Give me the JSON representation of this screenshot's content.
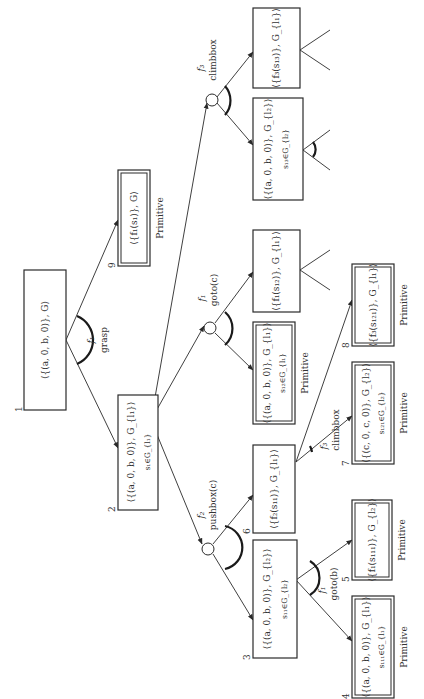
{
  "diagram": {
    "title": "",
    "orientation": "rotated-90-ccw",
    "nodes": [
      {
        "id": "1",
        "number": "1",
        "label": "⟨{(a, 0, b, 0)}, G⟩",
        "condition": "",
        "primitive": false,
        "primitive_label": ""
      },
      {
        "id": "9",
        "number": "9",
        "label": "⟨{f₁(s₁)}, G⟩",
        "condition": "",
        "primitive": true,
        "primitive_label": "Primitive"
      },
      {
        "id": "2",
        "number": "2",
        "label": "⟨{(a, 0, b, 0)}, G_{l₁}⟩",
        "condition": "s₁∈G_{l₁}",
        "primitive": false,
        "primitive_label": ""
      },
      {
        "id": "3",
        "number": "3",
        "label": "⟨{(a, 0, b, 0)}, G_{l₂}⟩",
        "condition": "s₁₁∈G_{l₂}",
        "primitive": false,
        "primitive_label": ""
      },
      {
        "id": "6",
        "number": "6",
        "label": "⟨{f₂(s₁₁)}, G_{l₁}⟩",
        "condition": "",
        "primitive": false,
        "primitive_label": ""
      },
      {
        "id": "4",
        "number": "4",
        "label": "⟨{(a, 0, b, 0)}, G_{l₁}⟩",
        "condition": "s₁₁₁∈G_{l₁}",
        "primitive": true,
        "primitive_label": "Primitive"
      },
      {
        "id": "5",
        "number": "5",
        "label": "⟨{f₁(s₁₁₁)}, G_{l₂}⟩",
        "condition": "",
        "primitive": true,
        "primitive_label": "Primitive"
      },
      {
        "id": "7",
        "number": "7",
        "label": "⟨{(c, 0, c, 0)}, G_{l₂}⟩",
        "condition": "s₁₂₁∈G_{l₂}",
        "primitive": true,
        "primitive_label": "Primitive"
      },
      {
        "id": "8",
        "number": "8",
        "label": "⟨{f₃(s₁₂₁)}, G_{l₁}⟩",
        "condition": "",
        "primitive": true,
        "primitive_label": "Primitive"
      },
      {
        "id": "g1",
        "number": "",
        "label": "⟨{(a, 0, b, 0)}, G_{l₁}⟩",
        "condition": "s₁₂∈G_{l₁}",
        "primitive": true,
        "primitive_label": "Primitive"
      },
      {
        "id": "g2",
        "number": "",
        "label": "⟨{f₁(s₁₂)}, G_{l₁}⟩",
        "condition": "",
        "primitive": false,
        "primitive_label": ""
      },
      {
        "id": "c1",
        "number": "",
        "label": "⟨{(a, 0, b, 0)}, G_{l₂}⟩",
        "condition": "s₁₃∈G_{l₂}",
        "primitive": false,
        "primitive_label": ""
      },
      {
        "id": "c2",
        "number": "",
        "label": "⟨{f₃(s₁₃)}, G_{l₁}⟩",
        "condition": "",
        "primitive": false,
        "primitive_label": ""
      }
    ],
    "operators": [
      {
        "id": "op-grasp",
        "function": "f₁",
        "action": "grasp"
      },
      {
        "id": "op-pushbox",
        "function": "f₂",
        "action": "pushbox(c)"
      },
      {
        "id": "op-goto-c",
        "function": "f₁",
        "action": "goto(c)"
      },
      {
        "id": "op-climbbox-top",
        "function": "f₃",
        "action": "climbbox"
      },
      {
        "id": "op-goto-b",
        "function": "f₁",
        "action": "goto(b)"
      },
      {
        "id": "op-climbbox-6",
        "function": "f₃",
        "action": "climbbox"
      }
    ],
    "edges": [
      {
        "from": "1",
        "to": "2"
      },
      {
        "from": "1",
        "to": "9"
      },
      {
        "from": "2",
        "to": "op-pushbox"
      },
      {
        "from": "2",
        "to": "op-goto-c"
      },
      {
        "from": "2",
        "to": "op-climbbox-top"
      },
      {
        "from": "op-pushbox",
        "to": "3"
      },
      {
        "from": "op-pushbox",
        "to": "6"
      },
      {
        "from": "op-goto-c",
        "to": "g1"
      },
      {
        "from": "op-goto-c",
        "to": "g2"
      },
      {
        "from": "op-climbbox-top",
        "to": "c1"
      },
      {
        "from": "op-climbbox-top",
        "to": "c2"
      },
      {
        "from": "3",
        "to": "4"
      },
      {
        "from": "3",
        "to": "5"
      },
      {
        "from": "6",
        "to": "7"
      },
      {
        "from": "6",
        "to": "8"
      }
    ]
  }
}
